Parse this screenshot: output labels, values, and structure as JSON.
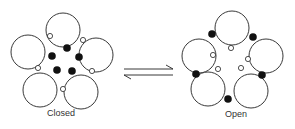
{
  "diagram": {
    "type": "equilibrium",
    "states": [
      {
        "id": "closed",
        "label": "Closed",
        "label_pos": [
          47,
          108
        ],
        "large_circles": [
          {
            "cx": 63,
            "cy": 30,
            "r": 17
          },
          {
            "cx": 28,
            "cy": 52,
            "r": 17
          },
          {
            "cx": 96,
            "cy": 55,
            "r": 17
          },
          {
            "cx": 40,
            "cy": 90,
            "r": 17
          },
          {
            "cx": 81,
            "cy": 92,
            "r": 17
          }
        ],
        "open_dots": [
          {
            "cx": 50,
            "cy": 36
          },
          {
            "cx": 83,
            "cy": 40
          },
          {
            "cx": 38,
            "cy": 68
          },
          {
            "cx": 92,
            "cy": 71
          },
          {
            "cx": 63,
            "cy": 89
          }
        ],
        "filled_dots": [
          {
            "cx": 67,
            "cy": 48
          },
          {
            "cx": 52,
            "cy": 56
          },
          {
            "cx": 79,
            "cy": 57
          },
          {
            "cx": 57,
            "cy": 70
          },
          {
            "cx": 72,
            "cy": 71
          }
        ]
      },
      {
        "id": "open",
        "label": "Open",
        "label_pos": [
          225,
          109
        ],
        "large_circles": [
          {
            "cx": 232,
            "cy": 28,
            "r": 17
          },
          {
            "cx": 199,
            "cy": 56,
            "r": 17
          },
          {
            "cx": 266,
            "cy": 56,
            "r": 17
          },
          {
            "cx": 208,
            "cy": 89,
            "r": 17
          },
          {
            "cx": 251,
            "cy": 91,
            "r": 17
          }
        ],
        "open_dots": [
          {
            "cx": 231,
            "cy": 48
          },
          {
            "cx": 213,
            "cy": 55
          },
          {
            "cx": 248,
            "cy": 59
          },
          {
            "cx": 218,
            "cy": 69
          },
          {
            "cx": 241,
            "cy": 68
          }
        ],
        "filled_dots": [
          {
            "cx": 212,
            "cy": 34
          },
          {
            "cx": 253,
            "cy": 37
          },
          {
            "cx": 196,
            "cy": 74
          },
          {
            "cx": 262,
            "cy": 75
          },
          {
            "cx": 228,
            "cy": 99
          }
        ]
      }
    ],
    "arrow": {
      "symbol": "equilibrium-arrows",
      "forward": {
        "x1": 124,
        "y1": 69,
        "x2": 173,
        "y2": 69
      },
      "reverse": {
        "x1": 173,
        "y1": 75,
        "x2": 124,
        "y2": 75
      }
    },
    "colors": {
      "stroke": "#222222",
      "fill_dark": "#111111",
      "background": "#ffffff",
      "text": "#333333"
    }
  }
}
